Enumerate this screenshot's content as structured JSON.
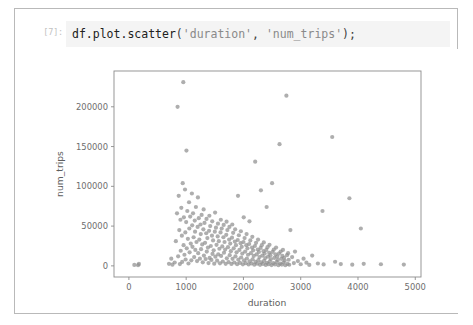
{
  "notebook": {
    "prompt_label": "[7]:",
    "code": {
      "full_text": "df.plot.scatter('duration', 'num_trips');",
      "tokens": [
        {
          "text": "df.plot.scatter",
          "kind": "plain"
        },
        {
          "text": "(",
          "kind": "punct"
        },
        {
          "text": "'duration'",
          "kind": "string"
        },
        {
          "text": ",",
          "kind": "punct"
        },
        {
          "text": " ",
          "kind": "plain"
        },
        {
          "text": "'num_trips'",
          "kind": "string"
        },
        {
          "text": ");",
          "kind": "punct"
        }
      ]
    }
  },
  "chart_data": {
    "type": "scatter",
    "title": "",
    "xlabel": "duration",
    "ylabel": "num_trips",
    "xlim": [
      -260,
      5100
    ],
    "ylim": [
      -14000,
      245000
    ],
    "xticks": [
      0,
      1000,
      2000,
      3000,
      4000,
      5000
    ],
    "xtick_labels": [
      "0",
      "1000",
      "2000",
      "3000",
      "4000",
      "5000"
    ],
    "yticks": [
      0,
      50000,
      100000,
      150000,
      200000
    ],
    "ytick_labels": [
      "0",
      "50000",
      "100000",
      "150000",
      "200000"
    ],
    "grid": false,
    "legend": null,
    "marker": {
      "color": "#8f8f8f",
      "opacity": 0.72,
      "radius": 2.1,
      "shape": "circle"
    },
    "series": [
      {
        "name": "num_trips vs duration",
        "points": [
          [
            95,
            1200
          ],
          [
            160,
            900
          ],
          [
            175,
            2400
          ],
          [
            700,
            2600
          ],
          [
            740,
            9000
          ],
          [
            760,
            1500
          ],
          [
            800,
            4200
          ],
          [
            820,
            31000
          ],
          [
            840,
            66000
          ],
          [
            850,
            200000
          ],
          [
            860,
            12000
          ],
          [
            870,
            88000
          ],
          [
            880,
            45000
          ],
          [
            890,
            2200
          ],
          [
            900,
            58000
          ],
          [
            905,
            19000
          ],
          [
            915,
            73000
          ],
          [
            925,
            38000
          ],
          [
            930,
            5000
          ],
          [
            940,
            104000
          ],
          [
            950,
            231000
          ],
          [
            955,
            26000
          ],
          [
            960,
            61000
          ],
          [
            970,
            14000
          ],
          [
            980,
            96000
          ],
          [
            985,
            42000
          ],
          [
            990,
            8000
          ],
          [
            1000,
            55000
          ],
          [
            1005,
            145000
          ],
          [
            1010,
            22000
          ],
          [
            1020,
            69000
          ],
          [
            1030,
            34000
          ],
          [
            1040,
            3000
          ],
          [
            1050,
            80000
          ],
          [
            1055,
            47000
          ],
          [
            1060,
            17000
          ],
          [
            1070,
            62000
          ],
          [
            1080,
            28000
          ],
          [
            1090,
            7000
          ],
          [
            1100,
            91000
          ],
          [
            1105,
            51000
          ],
          [
            1110,
            24000
          ],
          [
            1120,
            66000
          ],
          [
            1130,
            36000
          ],
          [
            1140,
            11000
          ],
          [
            1150,
            57000
          ],
          [
            1155,
            43000
          ],
          [
            1160,
            20000
          ],
          [
            1170,
            74000
          ],
          [
            1180,
            30000
          ],
          [
            1190,
            6000
          ],
          [
            1200,
            49000
          ],
          [
            1205,
            86000
          ],
          [
            1210,
            16000
          ],
          [
            1220,
            60000
          ],
          [
            1230,
            33000
          ],
          [
            1240,
            9000
          ],
          [
            1250,
            52000
          ],
          [
            1255,
            40000
          ],
          [
            1260,
            21000
          ],
          [
            1270,
            64000
          ],
          [
            1280,
            27000
          ],
          [
            1290,
            4500
          ],
          [
            1300,
            46000
          ],
          [
            1305,
            71000
          ],
          [
            1310,
            13000
          ],
          [
            1320,
            54000
          ],
          [
            1330,
            29000
          ],
          [
            1340,
            8500
          ],
          [
            1350,
            41000
          ],
          [
            1355,
            59000
          ],
          [
            1360,
            18000
          ],
          [
            1370,
            35000
          ],
          [
            1380,
            23000
          ],
          [
            1390,
            3500
          ],
          [
            1400,
            44000
          ],
          [
            1405,
            63000
          ],
          [
            1410,
            10000
          ],
          [
            1420,
            50000
          ],
          [
            1430,
            25000
          ],
          [
            1440,
            7500
          ],
          [
            1450,
            38000
          ],
          [
            1455,
            56000
          ],
          [
            1460,
            15000
          ],
          [
            1470,
            32000
          ],
          [
            1480,
            19500
          ],
          [
            1490,
            2800
          ],
          [
            1500,
            43000
          ],
          [
            1505,
            67000
          ],
          [
            1510,
            11500
          ],
          [
            1520,
            48000
          ],
          [
            1530,
            26500
          ],
          [
            1540,
            6500
          ],
          [
            1550,
            37000
          ],
          [
            1555,
            53000
          ],
          [
            1560,
            14500
          ],
          [
            1570,
            31000
          ],
          [
            1580,
            21500
          ],
          [
            1590,
            3200
          ],
          [
            1600,
            42000
          ],
          [
            1605,
            58000
          ],
          [
            1610,
            12500
          ],
          [
            1620,
            47000
          ],
          [
            1630,
            24500
          ],
          [
            1640,
            5500
          ],
          [
            1650,
            36000
          ],
          [
            1655,
            51500
          ],
          [
            1660,
            16500
          ],
          [
            1670,
            30000
          ],
          [
            1680,
            20500
          ],
          [
            1690,
            2600
          ],
          [
            1700,
            39000
          ],
          [
            1705,
            55500
          ],
          [
            1710,
            9500
          ],
          [
            1720,
            45000
          ],
          [
            1730,
            23500
          ],
          [
            1740,
            4800
          ],
          [
            1750,
            33000
          ],
          [
            1755,
            49000
          ],
          [
            1760,
            13500
          ],
          [
            1770,
            28000
          ],
          [
            1780,
            18500
          ],
          [
            1790,
            2400
          ],
          [
            1800,
            35500
          ],
          [
            1805,
            52000
          ],
          [
            1810,
            8800
          ],
          [
            1820,
            41500
          ],
          [
            1830,
            22000
          ],
          [
            1840,
            4200
          ],
          [
            1850,
            30500
          ],
          [
            1855,
            46000
          ],
          [
            1860,
            12000
          ],
          [
            1870,
            26000
          ],
          [
            1880,
            17000
          ],
          [
            1890,
            2100
          ],
          [
            1900,
            32500
          ],
          [
            1905,
            88000
          ],
          [
            1910,
            7800
          ],
          [
            1920,
            38500
          ],
          [
            1930,
            20000
          ],
          [
            1940,
            3800
          ],
          [
            1950,
            28500
          ],
          [
            1955,
            43500
          ],
          [
            1960,
            10500
          ],
          [
            1970,
            24000
          ],
          [
            1980,
            15500
          ],
          [
            1990,
            1900
          ],
          [
            2000,
            30000
          ],
          [
            2005,
            61000
          ],
          [
            2010,
            6800
          ],
          [
            2020,
            35000
          ],
          [
            2030,
            18000
          ],
          [
            2040,
            3400
          ],
          [
            2050,
            26000
          ],
          [
            2055,
            40000
          ],
          [
            2060,
            9200
          ],
          [
            2070,
            22000
          ],
          [
            2080,
            14000
          ],
          [
            2090,
            1700
          ],
          [
            2100,
            27500
          ],
          [
            2105,
            56000
          ],
          [
            2110,
            5800
          ],
          [
            2120,
            32000
          ],
          [
            2130,
            16000
          ],
          [
            2140,
            3000
          ],
          [
            2150,
            23000
          ],
          [
            2155,
            36500
          ],
          [
            2160,
            8200
          ],
          [
            2170,
            19500
          ],
          [
            2180,
            12500
          ],
          [
            2190,
            1500
          ],
          [
            2200,
            25000
          ],
          [
            2205,
            131000
          ],
          [
            2210,
            5000
          ],
          [
            2220,
            29000
          ],
          [
            2230,
            14500
          ],
          [
            2240,
            2700
          ],
          [
            2250,
            20500
          ],
          [
            2255,
            33000
          ],
          [
            2260,
            7200
          ],
          [
            2270,
            17500
          ],
          [
            2280,
            11000
          ],
          [
            2290,
            1300
          ],
          [
            2300,
            22500
          ],
          [
            2305,
            95000
          ],
          [
            2310,
            4400
          ],
          [
            2320,
            26000
          ],
          [
            2330,
            13000
          ],
          [
            2340,
            2400
          ],
          [
            2350,
            18500
          ],
          [
            2355,
            29500
          ],
          [
            2360,
            6400
          ],
          [
            2370,
            15500
          ],
          [
            2380,
            9800
          ],
          [
            2390,
            1150
          ],
          [
            2400,
            20000
          ],
          [
            2405,
            74000
          ],
          [
            2410,
            3900
          ],
          [
            2420,
            23500
          ],
          [
            2430,
            11500
          ],
          [
            2440,
            2100
          ],
          [
            2450,
            16500
          ],
          [
            2455,
            26500
          ],
          [
            2460,
            5600
          ],
          [
            2470,
            13500
          ],
          [
            2480,
            8600
          ],
          [
            2490,
            1000
          ],
          [
            2500,
            104000
          ],
          [
            2510,
            17500
          ],
          [
            2520,
            3400
          ],
          [
            2530,
            20500
          ],
          [
            2540,
            10000
          ],
          [
            2550,
            1850
          ],
          [
            2560,
            14500
          ],
          [
            2570,
            23000
          ],
          [
            2580,
            4900
          ],
          [
            2590,
            11800
          ],
          [
            2600,
            7500
          ],
          [
            2610,
            900
          ],
          [
            2620,
            15500
          ],
          [
            2630,
            153000
          ],
          [
            2640,
            2900
          ],
          [
            2650,
            18000
          ],
          [
            2660,
            8800
          ],
          [
            2670,
            1600
          ],
          [
            2680,
            12500
          ],
          [
            2690,
            20000
          ],
          [
            2700,
            4300
          ],
          [
            2710,
            10200
          ],
          [
            2720,
            6600
          ],
          [
            2730,
            800
          ],
          [
            2750,
            214000
          ],
          [
            2760,
            13500
          ],
          [
            2770,
            2500
          ],
          [
            2780,
            16000
          ],
          [
            2790,
            7700
          ],
          [
            2800,
            1400
          ],
          [
            2820,
            45000
          ],
          [
            2850,
            11000
          ],
          [
            2880,
            3500
          ],
          [
            2900,
            18000
          ],
          [
            2950,
            6000
          ],
          [
            3000,
            2000
          ],
          [
            3050,
            9000
          ],
          [
            3100,
            4000
          ],
          [
            3150,
            1200
          ],
          [
            3200,
            13000
          ],
          [
            3300,
            3000
          ],
          [
            3380,
            69000
          ],
          [
            3400,
            1800
          ],
          [
            3550,
            162000
          ],
          [
            3600,
            5200
          ],
          [
            3700,
            2200
          ],
          [
            3850,
            85000
          ],
          [
            3900,
            1500
          ],
          [
            4050,
            47000
          ],
          [
            4100,
            2600
          ],
          [
            4400,
            2000
          ],
          [
            4800,
            1600
          ]
        ]
      }
    ]
  }
}
